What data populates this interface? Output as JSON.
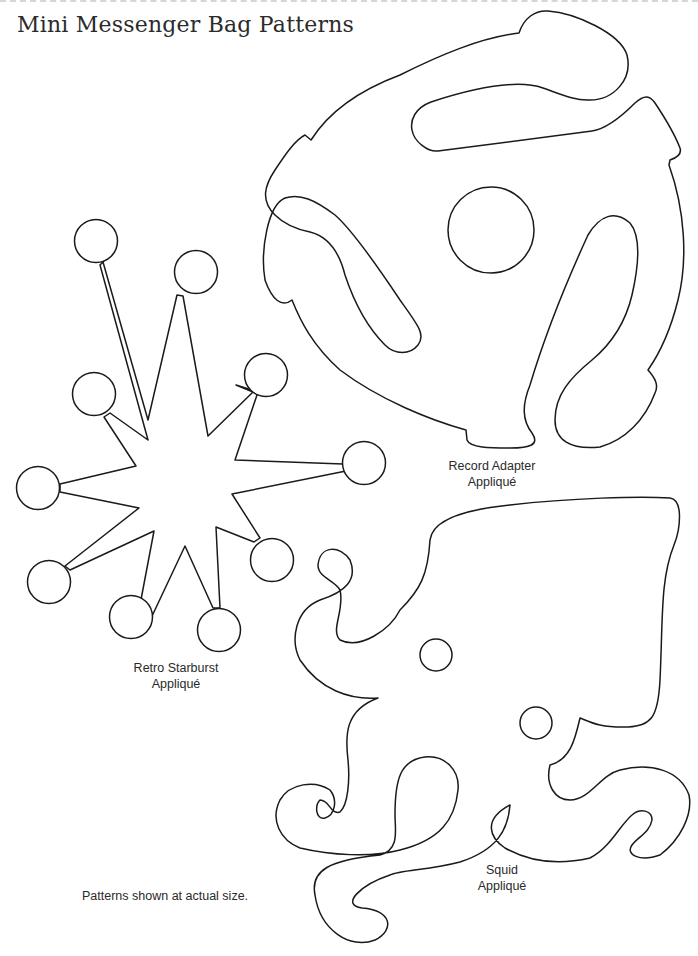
{
  "page": {
    "title": "Mini Messenger Bag Patterns",
    "footer_note": "Patterns shown at actual size.",
    "line_color": "#1a1a1a",
    "background": "#ffffff"
  },
  "patterns": [
    {
      "id": "record-adapter",
      "name_line1": "Record Adapter",
      "name_line2": "Appliqué"
    },
    {
      "id": "retro-starburst",
      "name_line1": "Retro Starburst",
      "name_line2": "Appliqué"
    },
    {
      "id": "squid",
      "name_line1": "Squid",
      "name_line2": "Appliqué"
    }
  ]
}
